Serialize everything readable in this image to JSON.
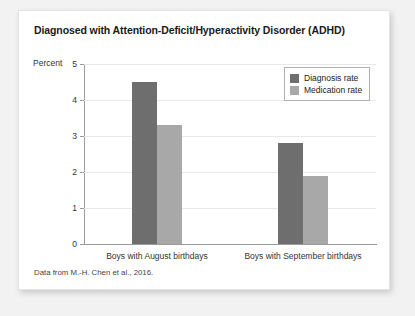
{
  "card": {
    "title": "Diagnosed with Attention-Deficit/Hyperactivity Disorder (ADHD)",
    "source_note": "Data from M.-H. Chen et al., 2016."
  },
  "chart_data": {
    "type": "bar",
    "title": "Diagnosed with Attention-Deficit/Hyperactivity Disorder (ADHD)",
    "xlabel": "",
    "ylabel": "Percent",
    "ylim": [
      0,
      5
    ],
    "yticks": [
      0,
      1,
      2,
      3,
      4,
      5
    ],
    "ytick_labels": [
      "0",
      "1",
      "2",
      "3",
      "4",
      "5"
    ],
    "grid": true,
    "legend_position": "top-right",
    "categories": [
      "Boys with August birthdays",
      "Boys with September birthdays"
    ],
    "series": [
      {
        "name": "Diagnosis rate",
        "color": "#6e6e6e",
        "values": [
          4.5,
          2.8
        ]
      },
      {
        "name": "Medication rate",
        "color": "#a8a8a8",
        "values": [
          3.3,
          1.9
        ]
      }
    ]
  }
}
